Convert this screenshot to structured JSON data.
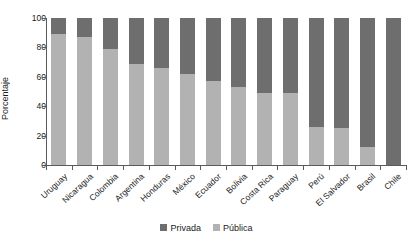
{
  "chart_data": {
    "type": "bar",
    "subtype": "stacked-100-percent",
    "title": "",
    "xlabel": "",
    "ylabel": "Porcentaje",
    "ylim": [
      0,
      100
    ],
    "yticks": [
      0,
      20,
      40,
      60,
      80,
      100
    ],
    "grid": false,
    "legend_position": "bottom-center",
    "categories": [
      "Uruguay",
      "Nicaragua",
      "Colombia",
      "Argentina",
      "Honduras",
      "México",
      "Ecuador",
      "Bolivia",
      "Costa Rica",
      "Paraguay",
      "Perú",
      "El Salvador",
      "Brasil",
      "Chile"
    ],
    "series": [
      {
        "name": "Privada",
        "color": "#6e6e6e",
        "values": [
          11,
          13,
          21,
          31,
          34,
          38,
          43,
          47,
          51,
          51,
          74,
          75,
          88,
          100
        ]
      },
      {
        "name": "Pública",
        "color": "#b2b2b2",
        "values": [
          89,
          87,
          79,
          69,
          66,
          62,
          57,
          53,
          49,
          49,
          26,
          25,
          12,
          0
        ]
      }
    ]
  },
  "legend": {
    "items": [
      {
        "label": "Privada",
        "color": "#6e6e6e"
      },
      {
        "label": "Pública",
        "color": "#b2b2b2"
      }
    ]
  },
  "axis": {
    "y_title": "Porcentaje",
    "y_tick_labels": [
      "100",
      "80",
      "60",
      "40",
      "20",
      "0"
    ]
  }
}
